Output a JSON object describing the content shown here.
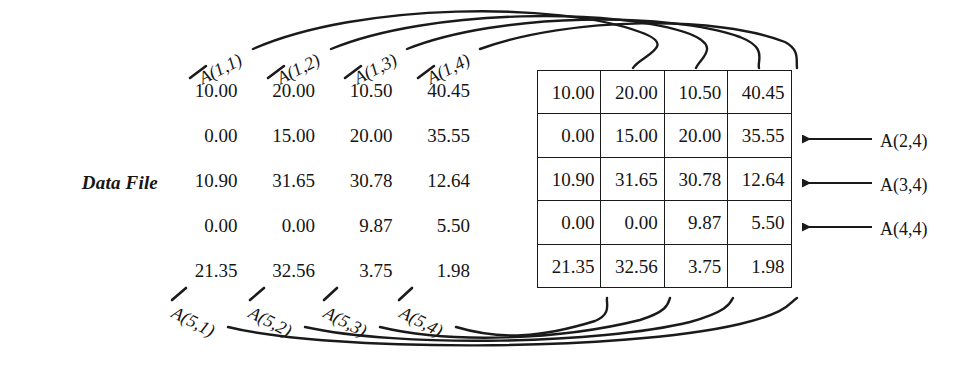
{
  "diagram": {
    "datafile_label": "Data File",
    "datafile_rows": [
      [
        "10.00",
        "20.00",
        "10.50",
        "40.45"
      ],
      [
        "0.00",
        "15.00",
        "20.00",
        "35.55"
      ],
      [
        "10.90",
        "31.65",
        "30.78",
        "12.64"
      ],
      [
        "0.00",
        "0.00",
        "9.87",
        "5.50"
      ],
      [
        "21.35",
        "32.56",
        "3.75",
        "1.98"
      ]
    ],
    "array_rows": [
      [
        "10.00",
        "20.00",
        "10.50",
        "40.45"
      ],
      [
        "0.00",
        "15.00",
        "20.00",
        "35.55"
      ],
      [
        "10.90",
        "31.65",
        "30.78",
        "12.64"
      ],
      [
        "0.00",
        "0.00",
        "9.87",
        "5.50"
      ],
      [
        "21.35",
        "32.56",
        "3.75",
        "1.98"
      ]
    ],
    "top_labels": [
      "A(1,1)",
      "A(1,2)",
      "A(1,3)",
      "A(1,4)"
    ],
    "bottom_labels": [
      "A(5,1)",
      "A(5,2)",
      "A(5,3)",
      "A(5,4)"
    ],
    "side_labels": [
      "A(2,4)",
      "A(3,4)",
      "A(4,4)"
    ],
    "colors": {
      "ink": "#151515",
      "rule": "#1a1a1a",
      "background": "#ffffff"
    }
  }
}
